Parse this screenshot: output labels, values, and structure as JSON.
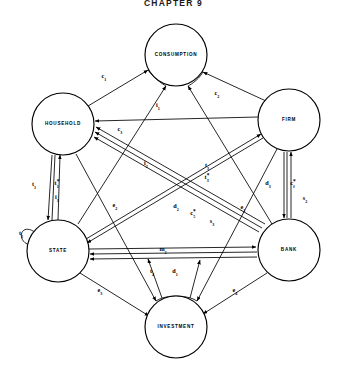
{
  "figure": {
    "title": "CHAPTER 9",
    "caption": ""
  },
  "diagram": {
    "type": "circular-flow-node-link",
    "node_radius": 31,
    "nodes": [
      {
        "id": "consumption",
        "label": "CONSUMPTION",
        "cx": 176,
        "cy": 55
      },
      {
        "id": "household",
        "label": "HOUSEHOLD",
        "cx": 63,
        "cy": 124
      },
      {
        "id": "firm",
        "label": "FIRM",
        "cx": 289,
        "cy": 120
      },
      {
        "id": "state",
        "label": "STATE",
        "cx": 58,
        "cy": 251
      },
      {
        "id": "bank",
        "label": "BANK",
        "cx": 289,
        "cy": 250
      },
      {
        "id": "investment",
        "label": "INVESTMENT",
        "cx": 176,
        "cy": 327
      }
    ],
    "edge_labels": [
      {
        "id": "c1",
        "base": "c",
        "sub": "1",
        "star": false,
        "x": 104,
        "y": 77
      },
      {
        "id": "c2",
        "base": "c",
        "sub": "2",
        "star": false,
        "x": 217,
        "y": 94
      },
      {
        "id": "i1",
        "base": "i",
        "sub": "1",
        "star": false,
        "x": 158,
        "y": 106
      },
      {
        "id": "c3",
        "base": "c",
        "sub": "3",
        "star": false,
        "x": 120,
        "y": 130
      },
      {
        "id": "t1",
        "base": "t",
        "sub": "1",
        "star": false,
        "x": 34,
        "y": 185
      },
      {
        "id": "t1star",
        "base": "t",
        "sub": "1",
        "star": true,
        "x": 57,
        "y": 184
      },
      {
        "id": "i3",
        "base": "i",
        "sub": "3",
        "star": false,
        "x": 57,
        "y": 198
      },
      {
        "id": "i2",
        "base": "i",
        "sub": "2",
        "star": false,
        "x": 146,
        "y": 164
      },
      {
        "id": "t3",
        "base": "t",
        "sub": "3",
        "star": false,
        "x": 207,
        "y": 166
      },
      {
        "id": "t3star",
        "base": "t",
        "sub": "3",
        "star": true,
        "x": 207,
        "y": 178
      },
      {
        "id": "e2",
        "base": "e",
        "sub": "2",
        "star": false,
        "x": 115,
        "y": 206
      },
      {
        "id": "d2",
        "base": "d",
        "sub": "2",
        "star": false,
        "x": 176,
        "y": 207
      },
      {
        "id": "c5",
        "base": "c",
        "sub": "5",
        "star": true,
        "x": 193,
        "y": 214
      },
      {
        "id": "s3",
        "base": "s",
        "sub": "3",
        "star": false,
        "x": 212,
        "y": 222
      },
      {
        "id": "e1",
        "base": "e",
        "sub": "1",
        "star": false,
        "x": 243,
        "y": 208
      },
      {
        "id": "d3",
        "base": "d",
        "sub": "3",
        "star": false,
        "x": 268,
        "y": 184
      },
      {
        "id": "cfstar",
        "base": "c",
        "sub": "f",
        "star": true,
        "x": 293,
        "y": 184
      },
      {
        "id": "s2",
        "base": "s",
        "sub": "2",
        "star": false,
        "x": 305,
        "y": 199
      },
      {
        "id": "t2",
        "base": "t",
        "sub": "2",
        "star": false,
        "x": 21,
        "y": 234
      },
      {
        "id": "m2",
        "base": "m",
        "sub": "2",
        "star": false,
        "x": 163,
        "y": 250
      },
      {
        "id": "t4",
        "base": "t",
        "sub": "4",
        "star": false,
        "x": 152,
        "y": 272
      },
      {
        "id": "d1",
        "base": "d",
        "sub": "1",
        "star": false,
        "x": 175,
        "y": 272
      },
      {
        "id": "e3",
        "base": "e",
        "sub": "3",
        "star": false,
        "x": 100,
        "y": 291
      },
      {
        "id": "e4",
        "base": "e",
        "sub": "4",
        "star": false,
        "x": 235,
        "y": 291
      }
    ],
    "flows": [
      {
        "from": "household",
        "to": "consumption",
        "label": "c1"
      },
      {
        "from": "firm",
        "to": "consumption",
        "label": "c2"
      },
      {
        "from": "state",
        "to": "consumption",
        "label": "c3"
      },
      {
        "from": "bank",
        "to": "consumption",
        "label": "c5"
      },
      {
        "from": "firm",
        "to": "household",
        "label": "i1"
      },
      {
        "from": "household",
        "to": "state",
        "label": "t1"
      },
      {
        "from": "state",
        "to": "household",
        "label": "t1star"
      },
      {
        "from": "bank",
        "to": "household",
        "label": "i3"
      },
      {
        "from": "bank",
        "to": "household",
        "label": "i2"
      },
      {
        "from": "firm",
        "to": "state",
        "label": "t3"
      },
      {
        "from": "state",
        "to": "firm",
        "label": "t3star"
      },
      {
        "from": "state",
        "to": "bank",
        "label": "m2"
      },
      {
        "from": "firm",
        "to": "bank",
        "label": "d3"
      },
      {
        "from": "bank",
        "to": "firm",
        "label": "cfstar"
      },
      {
        "from": "bank",
        "to": "firm",
        "label": "s2"
      },
      {
        "from": "state",
        "to": "state",
        "label": "t2"
      },
      {
        "from": "state",
        "to": "investment",
        "label": "e3"
      },
      {
        "from": "bank",
        "to": "investment",
        "label": "e4"
      },
      {
        "from": "household",
        "to": "investment",
        "label": "e2"
      },
      {
        "from": "firm",
        "to": "investment",
        "label": "e1"
      },
      {
        "from": "investment",
        "to": "state",
        "label": "t4"
      },
      {
        "from": "investment",
        "to": "bank",
        "label": "d1"
      },
      {
        "from": "bank",
        "to": "state",
        "label": "d2"
      },
      {
        "from": "bank",
        "to": "state",
        "label": "s3"
      }
    ]
  },
  "colors": {
    "stroke": "#000000",
    "fill": "#ffffff",
    "background": "#ffffff"
  }
}
